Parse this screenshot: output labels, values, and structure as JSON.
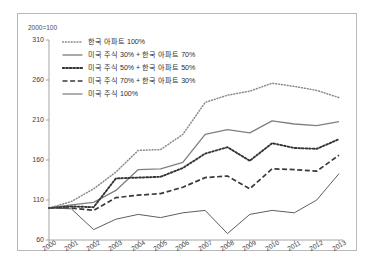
{
  "chart_data": {
    "type": "line",
    "title": "",
    "subtitle": "",
    "index_note": "2000=100",
    "xlabel": "",
    "ylabel": "",
    "x": [
      2000,
      2001,
      2002,
      2003,
      2004,
      2005,
      2006,
      2007,
      2008,
      2009,
      2010,
      2011,
      2012,
      2013
    ],
    "categories": [
      "2000",
      "2001",
      "2002",
      "2003",
      "2004",
      "2005",
      "2006",
      "2007",
      "2008",
      "2009",
      "2010",
      "2011",
      "2012",
      "2013"
    ],
    "xlim": [
      2000,
      2013
    ],
    "ylim": [
      60,
      310
    ],
    "yticks": [
      60,
      110,
      160,
      210,
      260,
      310
    ],
    "ytick_labels": [
      "60",
      "110",
      "160",
      "210",
      "260",
      "310"
    ],
    "grid": false,
    "legend_position": "inside upper-left",
    "series": [
      {
        "name": "한국 아파트 100%",
        "style": "fine-dotted",
        "color": "#8a8a8a",
        "values": [
          100,
          108,
          124,
          145,
          172,
          173,
          192,
          232,
          241,
          246,
          256,
          252,
          247,
          238
        ]
      },
      {
        "name": "미국 주식 30% + 한국 아파트 70%",
        "style": "solid",
        "color": "#808080",
        "values": [
          100,
          104,
          107,
          122,
          148,
          149,
          157,
          192,
          198,
          194,
          209,
          205,
          203,
          208
        ]
      },
      {
        "name": "미국 주식 50% + 한국 아파트 50%",
        "style": "bold-dotted",
        "color": "#333333",
        "values": [
          100,
          102,
          101,
          137,
          138,
          139,
          150,
          168,
          176,
          159,
          181,
          175,
          174,
          186
        ]
      },
      {
        "name": "미국 주식 70% + 한국 아파트 30%",
        "style": "dashed",
        "color": "#3a3a3a",
        "values": [
          100,
          100,
          97,
          113,
          116,
          118,
          126,
          138,
          140,
          124,
          149,
          148,
          146,
          166
        ]
      },
      {
        "name": "미국 주식 100%",
        "style": "thin-solid",
        "color": "#555555",
        "values": [
          100,
          99,
          73,
          86,
          92,
          88,
          94,
          97,
          68,
          92,
          97,
          94,
          110,
          143
        ]
      }
    ]
  }
}
